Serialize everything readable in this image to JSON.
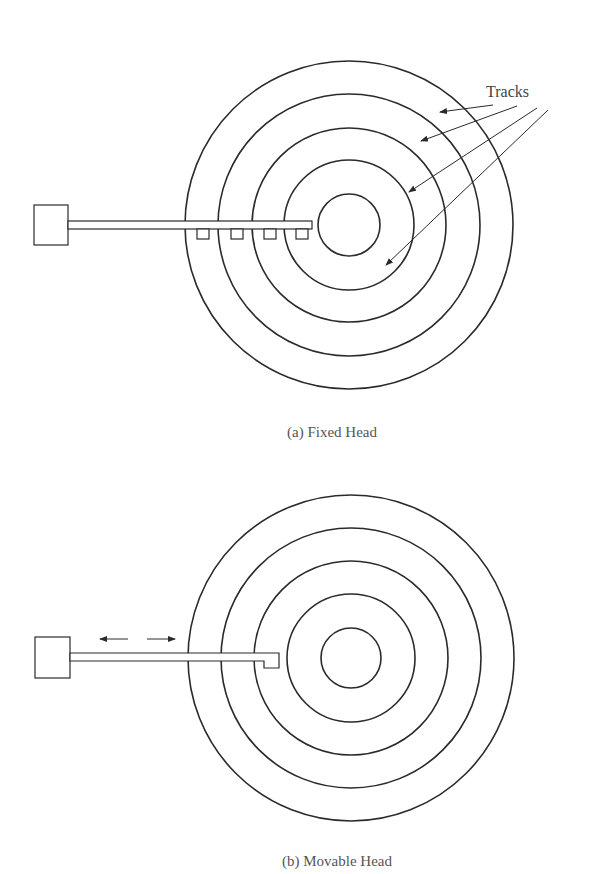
{
  "figure_a": {
    "caption": "(a) Fixed Head",
    "label": "Tracks",
    "center": [
      349,
      225
    ],
    "radii": [
      164,
      131,
      97,
      65,
      31
    ],
    "head_count": 4
  },
  "figure_b": {
    "caption": "(b) Movable Head",
    "center": [
      351,
      658
    ],
    "radii": [
      163,
      130,
      97,
      64,
      30
    ],
    "motion_arrows": [
      "left",
      "right"
    ]
  },
  "colors": {
    "stroke": "#2a2a2a",
    "text": "#555555"
  }
}
